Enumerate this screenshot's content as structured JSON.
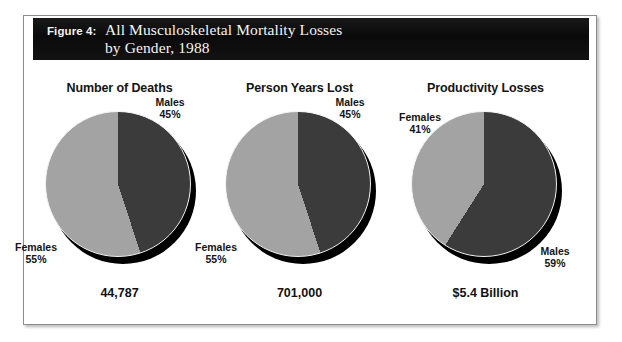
{
  "figure": {
    "label": "Figure 4:",
    "title": "All Musculoskeletal Mortality Losses\nby Gender, 1988"
  },
  "colors": {
    "males_slice": "#3b3b3b",
    "females_slice": "#a3a3a3",
    "shadow": "#000000",
    "banner_bg": "#100f0f",
    "banner_text": "#f4f3f0",
    "frame_border": "#8d8d8d",
    "page_bg": "#ffffff"
  },
  "chart_data": [
    {
      "type": "pie",
      "title": "Number of Deaths",
      "total_label": "44,787",
      "categories": [
        "Males",
        "Females"
      ],
      "values": [
        45,
        55
      ],
      "labels": [
        "Males\n45%",
        "Females\n55%"
      ],
      "legend": "inline-callout",
      "start_angle_deg": 0,
      "direction": "clockwise"
    },
    {
      "type": "pie",
      "title": "Person Years Lost",
      "total_label": "701,000",
      "categories": [
        "Males",
        "Females"
      ],
      "values": [
        45,
        55
      ],
      "labels": [
        "Males\n45%",
        "Females\n55%"
      ],
      "legend": "inline-callout",
      "start_angle_deg": 0,
      "direction": "clockwise"
    },
    {
      "type": "pie",
      "title": "Productivity Losses",
      "total_label": "$5.4 Billion",
      "categories": [
        "Males",
        "Females"
      ],
      "values": [
        59,
        41
      ],
      "labels": [
        "Males\n59%",
        "Females\n41%"
      ],
      "legend": "inline-callout",
      "start_angle_deg": 0,
      "direction": "clockwise"
    }
  ]
}
